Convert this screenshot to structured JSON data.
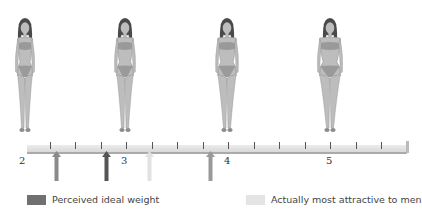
{
  "figures": [
    {
      "label": "figure-thin",
      "center_x": 25,
      "width_scale": 0.82
    },
    {
      "label": "figure-slim",
      "center_x": 125,
      "width_scale": 0.92
    },
    {
      "label": "figure-average",
      "center_x": 227,
      "width_scale": 1.02
    },
    {
      "label": "figure-heavy",
      "center_x": 330,
      "width_scale": 1.15
    }
  ],
  "scale": {
    "labels": [
      {
        "text": "2",
        "x": 19
      },
      {
        "text": "3",
        "x": 121
      },
      {
        "text": "4",
        "x": 224
      },
      {
        "text": "5",
        "x": 326
      }
    ],
    "tick_positions": [
      50,
      75,
      101,
      126,
      152,
      177,
      203,
      228,
      254,
      279,
      305,
      330,
      356,
      381
    ]
  },
  "arrows": [
    {
      "x": 53,
      "value": 2.33,
      "color": "#8a8a8a"
    },
    {
      "x": 103,
      "value": 2.82,
      "color": "#555555"
    },
    {
      "x": 146,
      "value": 3.25,
      "color": "#e2e2e2"
    },
    {
      "x": 207,
      "value": 3.84,
      "color": "#999999"
    }
  ],
  "legend": {
    "items": [
      {
        "label": "Perceived ideal weight",
        "color": "#707070"
      },
      {
        "label": "Actually most attractive to men",
        "color": "#e4e4e4"
      }
    ]
  },
  "chart_data": {
    "type": "scale-diagram",
    "title": "",
    "scale_range": [
      2,
      5
    ],
    "scale_tick_labels": [
      "2",
      "3",
      "4",
      "5"
    ],
    "markers": [
      {
        "value": 2.33,
        "color": "#8a8a8a"
      },
      {
        "value": 2.82,
        "color": "#555555",
        "series": "Perceived ideal weight"
      },
      {
        "value": 3.25,
        "color": "#e2e2e2",
        "series": "Actually most attractive to men"
      },
      {
        "value": 3.84,
        "color": "#999999"
      }
    ],
    "legend": [
      "Perceived ideal weight",
      "Actually most attractive to men"
    ]
  }
}
